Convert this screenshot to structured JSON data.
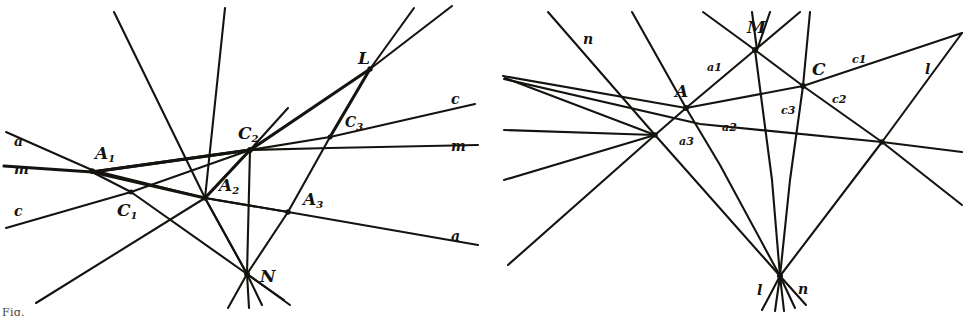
{
  "figure": {
    "caption_partial": "Fig.",
    "ink_color": "#15130f",
    "background_color": "#ffffff",
    "panels": [
      {
        "id": "left-panel",
        "name": "left-diagram",
        "points": [
          {
            "id": "A1",
            "label": "A",
            "sub": "1",
            "x": 92,
            "y": 170
          },
          {
            "id": "A2",
            "label": "A",
            "sub": "2",
            "x": 205,
            "y": 198
          },
          {
            "id": "A3",
            "label": "A",
            "sub": "3",
            "x": 288,
            "y": 212
          },
          {
            "id": "C1",
            "label": "C",
            "sub": "1",
            "x": 131,
            "y": 192
          },
          {
            "id": "C2",
            "label": "C",
            "sub": "2",
            "x": 250,
            "y": 150
          },
          {
            "id": "C3",
            "label": "C",
            "sub": "3",
            "x": 330,
            "y": 137
          },
          {
            "id": "L",
            "label": "L",
            "sub": "",
            "x": 370,
            "y": 69
          },
          {
            "id": "N",
            "label": "N",
            "sub": "",
            "x": 247,
            "y": 274
          }
        ],
        "line_labels": [
          {
            "id": "a-left",
            "text": "a",
            "x": 14,
            "y": 142
          },
          {
            "id": "m-left",
            "text": "m",
            "x": 14,
            "y": 170
          },
          {
            "id": "c-left",
            "text": "c",
            "x": 14,
            "y": 212
          },
          {
            "id": "c-right",
            "text": "c",
            "x": 451,
            "y": 100
          },
          {
            "id": "m-right",
            "text": "m",
            "x": 451,
            "y": 147
          },
          {
            "id": "a-right",
            "text": "a",
            "x": 451,
            "y": 237
          }
        ]
      },
      {
        "id": "right-panel",
        "name": "right-diagram",
        "points": [
          {
            "id": "M",
            "label": "M",
            "sub": "",
            "x": 755,
            "y": 50
          },
          {
            "id": "A",
            "label": "A",
            "sub": "",
            "x": 686,
            "y": 108
          },
          {
            "id": "C",
            "label": "C",
            "sub": "",
            "x": 803,
            "y": 86
          },
          {
            "id": "Pleft",
            "label": "",
            "sub": "",
            "x": 655,
            "y": 135
          },
          {
            "id": "Pright",
            "label": "",
            "sub": "",
            "x": 882,
            "y": 142
          },
          {
            "id": "V",
            "label": "",
            "sub": "",
            "x": 780,
            "y": 276
          }
        ],
        "line_labels": [
          {
            "id": "n-top",
            "text": "n",
            "x": 583,
            "y": 40
          },
          {
            "id": "l-right",
            "text": "l",
            "x": 925,
            "y": 70
          },
          {
            "id": "a1",
            "text": "a1",
            "x": 713,
            "y": 68
          },
          {
            "id": "a2",
            "text": "a2",
            "x": 727,
            "y": 128
          },
          {
            "id": "a3",
            "text": "a3",
            "x": 685,
            "y": 142
          },
          {
            "id": "c1",
            "text": "c1",
            "x": 858,
            "y": 60
          },
          {
            "id": "c2",
            "text": "c2",
            "x": 838,
            "y": 100
          },
          {
            "id": "c3",
            "text": "c3",
            "x": 787,
            "y": 111
          },
          {
            "id": "l-bottom",
            "text": "l",
            "x": 761,
            "y": 291
          },
          {
            "id": "n-bottom",
            "text": "n",
            "x": 800,
            "y": 290
          }
        ]
      }
    ]
  }
}
